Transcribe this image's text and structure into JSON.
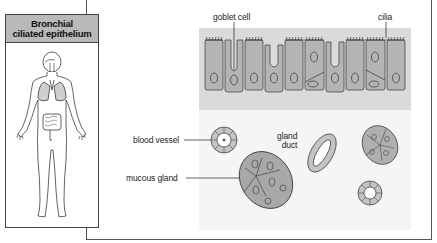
{
  "panel": {
    "title_line1": "Bronchial",
    "title_line2": "ciliated epithelium"
  },
  "labels": {
    "goblet_cell": "goblet cell",
    "cilia": "cilia",
    "blood_vessel": "blood vessel",
    "gland_duct_line1": "gland",
    "gland_duct_line2": "duct",
    "mucous_gland": "mucous gland"
  },
  "colors": {
    "header_gray": "#b9b9b9",
    "cell_fill": "#b4b4b4",
    "band_bg": "#dcdcdc",
    "lower_bg": "#f4f4f4",
    "lung_fill": "#d0d0d0"
  }
}
